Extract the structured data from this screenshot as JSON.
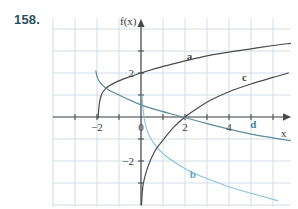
{
  "figure": {
    "problem_number": "158.",
    "axis_labels": {
      "y_axis": "f(x)",
      "x_axis": "x"
    },
    "tick_labels": {
      "x": [
        {
          "value": -2,
          "text": "−2"
        },
        {
          "value": 0,
          "text": "0"
        },
        {
          "value": 2,
          "text": "2"
        },
        {
          "value": 4,
          "text": "4"
        }
      ],
      "y": [
        {
          "value": 2,
          "text": "2"
        },
        {
          "value": -2,
          "text": "−2"
        }
      ]
    },
    "curve_labels": [
      {
        "id": "a",
        "text": "a"
      },
      {
        "id": "b",
        "text": "b"
      },
      {
        "id": "c",
        "text": "c"
      },
      {
        "id": "d",
        "text": "d"
      }
    ],
    "colors": {
      "problem_number": "#2b4f62",
      "grid": "#c9d4de",
      "axis": "#4a4a4a",
      "curve_a": "#4a4a4a",
      "curve_b": "#8cc4dc",
      "curve_c": "#4a4a4a",
      "curve_d": "#5b8b9b",
      "label_b": "#5aa6c4",
      "label_d": "#3d7f99",
      "background": "#ffffff"
    }
  },
  "chart_data": {
    "type": "line",
    "title": "",
    "xlabel": "x",
    "ylabel": "f(x)",
    "xlim": [
      -4,
      7
    ],
    "ylim": [
      -4,
      4
    ],
    "grid": true,
    "legend": "inline-curve-labels",
    "x_ticks": [
      -2,
      0,
      2,
      4
    ],
    "y_ticks": [
      2,
      -2
    ],
    "series": [
      {
        "name": "a",
        "label_position": {
          "x": 2.2,
          "y": 2.6
        },
        "color": "#4a4a4a",
        "description": "logarithmic curve rising, vertical asymptote near x = -2",
        "points": [
          [
            -1.95,
            -0.05
          ],
          [
            -1.9,
            0.55
          ],
          [
            -1.8,
            1.0
          ],
          [
            -1.6,
            1.3
          ],
          [
            -1.2,
            1.55
          ],
          [
            -0.6,
            1.8
          ],
          [
            0,
            2.0
          ],
          [
            1,
            2.3
          ],
          [
            2,
            2.55
          ],
          [
            3,
            2.78
          ],
          [
            4,
            2.95
          ],
          [
            5,
            3.1
          ],
          [
            6,
            3.25
          ],
          [
            6.8,
            3.35
          ]
        ]
      },
      {
        "name": "b",
        "label_position": {
          "x": 2.35,
          "y": -2.75
        },
        "color": "#8cc4dc",
        "description": "decreasing curve, vertical asymptote at x = 0, falling through fourth quadrant",
        "points": [
          [
            0.05,
            1.0
          ],
          [
            0.1,
            0.3
          ],
          [
            0.2,
            -0.35
          ],
          [
            0.4,
            -0.9
          ],
          [
            0.7,
            -1.35
          ],
          [
            1.1,
            -1.75
          ],
          [
            1.6,
            -2.1
          ],
          [
            2.2,
            -2.45
          ],
          [
            3,
            -2.8
          ],
          [
            3.8,
            -3.1
          ],
          [
            4.6,
            -3.35
          ],
          [
            5.5,
            -3.6
          ],
          [
            6.2,
            -3.8
          ]
        ]
      },
      {
        "name": "c",
        "label_position": {
          "x": 4.7,
          "y": 1.65
        },
        "color": "#4a4a4a",
        "description": "increasing logarithmic curve, vertical asymptote at x = 0, x-intercept at x = 2",
        "points": [
          [
            0.02,
            -4.0
          ],
          [
            0.1,
            -3.05
          ],
          [
            0.3,
            -2.3
          ],
          [
            0.6,
            -1.6
          ],
          [
            1.0,
            -1.05
          ],
          [
            1.5,
            -0.45
          ],
          [
            2.0,
            0
          ],
          [
            2.6,
            0.42
          ],
          [
            3.2,
            0.78
          ],
          [
            4.0,
            1.15
          ],
          [
            5.0,
            1.5
          ],
          [
            6.0,
            1.8
          ],
          [
            6.7,
            2.0
          ]
        ]
      },
      {
        "name": "d",
        "label_position": {
          "x": 5.1,
          "y": -0.5
        },
        "color": "#5b8b9b",
        "description": "decreasing curve from upper left, crosses x-axis near x = 2",
        "points": [
          [
            -2.05,
            2.1
          ],
          [
            -2.0,
            1.85
          ],
          [
            -1.85,
            1.55
          ],
          [
            -1.5,
            1.25
          ],
          [
            -1.0,
            1.0
          ],
          [
            -0.4,
            0.72
          ],
          [
            0,
            0.55
          ],
          [
            0.8,
            0.3
          ],
          [
            1.6,
            0.08
          ],
          [
            2.2,
            -0.08
          ],
          [
            3,
            -0.3
          ],
          [
            4,
            -0.55
          ],
          [
            5,
            -0.78
          ],
          [
            6,
            -0.95
          ],
          [
            6.8,
            -1.08
          ]
        ]
      }
    ]
  }
}
